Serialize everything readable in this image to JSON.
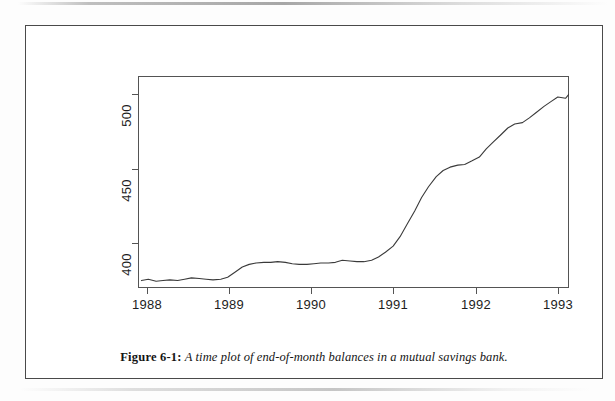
{
  "figure": {
    "caption_label": "Figure 6-1:",
    "caption_text": "A time plot of end-of-month balances in a mutual savings bank."
  },
  "chart_data": {
    "type": "line",
    "title": "",
    "subtitle": "",
    "xlabel": "",
    "ylabel": "",
    "grid": false,
    "legend": false,
    "legend_position": "none",
    "line_color": "#3a3a3a",
    "frame_color": "#545454",
    "xlim": [
      1988.0,
      1993.0
    ],
    "ylim": [
      355.0,
      512.0
    ],
    "x_tick_labels": [
      "1988",
      "1989",
      "1990",
      "1991",
      "1992",
      "1993"
    ],
    "x_tick_values": [
      1988,
      1989,
      1990,
      1991,
      1992,
      1993
    ],
    "y_tick_labels": [
      "400",
      "450",
      "500"
    ],
    "y_tick_values": [
      400,
      450,
      500
    ],
    "series": [
      {
        "name": "End-of-month balances",
        "x": [
          1988.04,
          1988.12,
          1988.21,
          1988.29,
          1988.37,
          1988.46,
          1988.54,
          1988.62,
          1988.71,
          1988.79,
          1988.87,
          1988.96,
          1989.04,
          1989.12,
          1989.21,
          1989.29,
          1989.37,
          1989.46,
          1989.54,
          1989.62,
          1989.71,
          1989.79,
          1989.87,
          1989.96,
          1990.04,
          1990.12,
          1990.21,
          1990.29,
          1990.37,
          1990.46,
          1990.54,
          1990.62,
          1990.71,
          1990.79,
          1990.87,
          1990.96,
          1991.04,
          1991.12,
          1991.21,
          1991.29,
          1991.37,
          1991.46,
          1991.54,
          1991.62,
          1991.71,
          1991.79,
          1991.87,
          1991.96,
          1992.04,
          1992.12,
          1992.21,
          1992.29,
          1992.37,
          1992.46,
          1992.54,
          1992.62,
          1992.71,
          1992.79,
          1992.87,
          1992.96,
          1993.0
        ],
        "values": [
          360.5,
          361.5,
          360.0,
          360.5,
          361.0,
          360.5,
          361.5,
          362.5,
          362.0,
          361.5,
          361.0,
          361.5,
          363.0,
          366.5,
          370.5,
          372.5,
          373.5,
          374.0,
          374.0,
          374.5,
          374.0,
          373.0,
          372.5,
          372.5,
          373.0,
          373.5,
          373.5,
          374.0,
          375.5,
          375.0,
          374.5,
          374.5,
          375.5,
          378.0,
          381.5,
          386.0,
          393.0,
          402.0,
          412.0,
          422.0,
          430.0,
          437.5,
          442.0,
          444.5,
          446.0,
          446.5,
          449.0,
          452.0,
          458.0,
          463.0,
          468.5,
          473.5,
          476.5,
          477.5,
          481.0,
          485.0,
          489.5,
          493.0,
          496.5,
          495.5,
          498.5
        ]
      }
    ]
  },
  "axes": {
    "y_ticks": [
      {
        "label": "500",
        "value": 500
      },
      {
        "label": "450",
        "value": 450
      },
      {
        "label": "400",
        "value": 400
      }
    ],
    "x_ticks": [
      {
        "label": "1988",
        "value": 1988
      },
      {
        "label": "1989",
        "value": 1989
      },
      {
        "label": "1990",
        "value": 1990
      },
      {
        "label": "1991",
        "value": 1991
      },
      {
        "label": "1992",
        "value": 1992
      },
      {
        "label": "1993",
        "value": 1993
      }
    ]
  }
}
